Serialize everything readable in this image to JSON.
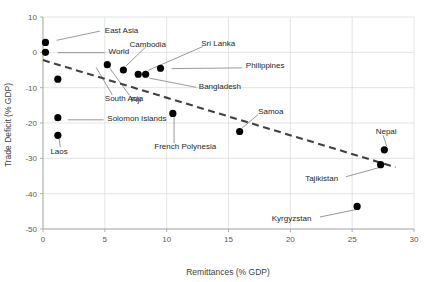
{
  "chart_data": {
    "type": "scatter",
    "title": "",
    "xlabel": "Remittances (% GDP)",
    "ylabel": "Trade Deficit (% GDP)",
    "xlim": [
      0,
      30
    ],
    "ylim": [
      -50,
      10
    ],
    "xticks": [
      0,
      5,
      10,
      15,
      20,
      25,
      30
    ],
    "yticks": [
      10,
      0,
      -10,
      -20,
      -30,
      -40,
      -50
    ],
    "xtick_labels": [
      "0",
      "5",
      "10",
      "15",
      "20",
      "25",
      "30"
    ],
    "ytick_labels": [
      "10",
      "0",
      "-10",
      "-20",
      "-30",
      "-40",
      "-50"
    ],
    "grid": true,
    "legend": "none",
    "marker_color": "#000000",
    "trendline": {
      "style": "dashed",
      "color": "#404040",
      "x_start": 0.0,
      "y_start": -2.2,
      "x_end": 28.5,
      "y_end": -32.5
    },
    "points": [
      {
        "name": "East Asia",
        "x": 0.2,
        "y": 2.8,
        "label_x": 5.0,
        "label_y": 6.3,
        "anchor": "start"
      },
      {
        "name": "World",
        "x": 0.2,
        "y": 0.0,
        "label_x": 5.3,
        "label_y": 0.3,
        "anchor": "start"
      },
      {
        "name": "South Asia",
        "x": 1.2,
        "y": -7.6,
        "label_x": 5.0,
        "label_y": -12.9,
        "anchor": "start"
      },
      {
        "name": "Solomon Islands",
        "x": 1.2,
        "y": -18.5,
        "label_x": 5.2,
        "label_y": -18.7,
        "anchor": "start"
      },
      {
        "name": "Laos",
        "x": 1.2,
        "y": -23.5,
        "label_x": 0.6,
        "label_y": -27.8,
        "anchor": "start"
      },
      {
        "name": "Fiji",
        "x": 5.2,
        "y": -3.5,
        "label_x": 7.1,
        "label_y": -13.1,
        "anchor": "start"
      },
      {
        "name": "Cambodia",
        "x": 6.5,
        "y": -5.0,
        "label_x": 7.0,
        "label_y": 2.5,
        "anchor": "start"
      },
      {
        "name": "Bangladesh",
        "x": 7.7,
        "y": -6.2,
        "label_x": 12.6,
        "label_y": -9.6,
        "anchor": "start"
      },
      {
        "name": "Sri Lanka",
        "x": 8.3,
        "y": -6.2,
        "label_x": 12.8,
        "label_y": 2.6,
        "anchor": "start"
      },
      {
        "name": "Philippines",
        "x": 9.5,
        "y": -4.5,
        "label_x": 16.4,
        "label_y": -3.7,
        "anchor": "start"
      },
      {
        "name": "French Polynesia",
        "x": 10.5,
        "y": -17.3,
        "label_x": 9.0,
        "label_y": -26.6,
        "anchor": "start"
      },
      {
        "name": "Samoa",
        "x": 15.9,
        "y": -22.4,
        "label_x": 17.4,
        "label_y": -16.5,
        "anchor": "start"
      },
      {
        "name": "Nepal",
        "x": 27.6,
        "y": -27.6,
        "label_x": 26.9,
        "label_y": -22.4,
        "anchor": "start"
      },
      {
        "name": "Tajikistan",
        "x": 27.3,
        "y": -31.8,
        "label_x": 21.2,
        "label_y": -35.5,
        "anchor": "start"
      },
      {
        "name": "Kyrgyzstan",
        "x": 25.4,
        "y": -43.6,
        "label_x": 18.5,
        "label_y": -47.0,
        "anchor": "start"
      }
    ],
    "leaders": [
      {
        "name": "East Asia",
        "x1": 4.6,
        "y1": 6.0,
        "x2": 1.1,
        "y2": 3.4
      },
      {
        "name": "World",
        "x1": 5.0,
        "y1": -0.1,
        "x2": 1.2,
        "y2": -0.1
      },
      {
        "name": "South Asia",
        "x1": 5.6,
        "y1": -12.0,
        "x2": 4.3,
        "y2": -4.3
      },
      {
        "name": "Solomon Islands",
        "x1": 4.9,
        "y1": -19.1,
        "x2": 2.0,
        "y2": -19.1
      },
      {
        "name": "Laos",
        "x1": 1.4,
        "y1": -26.8,
        "x2": 1.3,
        "y2": -24.5
      },
      {
        "name": "Fiji",
        "x1": 7.0,
        "y1": -12.2,
        "x2": 5.4,
        "y2": -4.5
      },
      {
        "name": "Cambodia",
        "x1": 8.3,
        "y1": 1.5,
        "x2": 6.7,
        "y2": -3.9
      },
      {
        "name": "Bangladesh",
        "x1": 12.4,
        "y1": -9.9,
        "x2": 8.6,
        "y2": -7.3
      },
      {
        "name": "Sri Lanka",
        "x1": 12.9,
        "y1": 1.6,
        "x2": 8.5,
        "y2": -5.1
      },
      {
        "name": "Philippines",
        "x1": 16.1,
        "y1": -4.4,
        "x2": 10.4,
        "y2": -4.6
      },
      {
        "name": "French Polynesia",
        "x1": 10.6,
        "y1": -25.7,
        "x2": 10.6,
        "y2": -18.4
      },
      {
        "name": "Samoa",
        "x1": 17.4,
        "y1": -17.6,
        "x2": 16.1,
        "y2": -21.4
      },
      {
        "name": "Nepal",
        "x1": 27.5,
        "y1": -23.5,
        "x2": 27.8,
        "y2": -26.6
      },
      {
        "name": "Tajikistan",
        "x1": 24.5,
        "y1": -35.2,
        "x2": 27.2,
        "y2": -32.6
      },
      {
        "name": "Kyrgyzstan",
        "x1": 22.4,
        "y1": -46.6,
        "x2": 25.3,
        "y2": -44.5
      }
    ]
  }
}
